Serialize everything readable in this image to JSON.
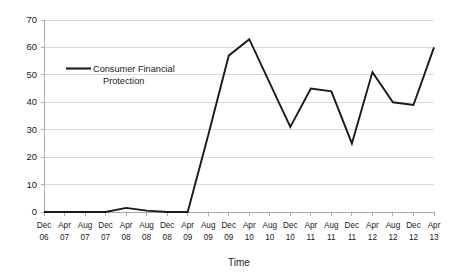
{
  "chart_data": {
    "type": "line",
    "title": "",
    "xlabel": "Time",
    "ylabel": "",
    "grid": true,
    "legend_position": "inside-upper-left",
    "xlim_categories": true,
    "ylim": [
      0,
      70
    ],
    "ytick_step": 10,
    "ytick_labels": [
      "0",
      "10",
      "20",
      "30",
      "40",
      "50",
      "60",
      "70"
    ],
    "ytick_values": [
      0,
      10,
      20,
      30,
      40,
      50,
      60,
      70
    ],
    "categories": [
      "Dec 06",
      "Apr 07",
      "Aug 07",
      "Dec 07",
      "Apr 08",
      "Aug 08",
      "Dec 08",
      "Apr 09",
      "Aug 09",
      "Dec 09",
      "Apr 10",
      "Aug 10",
      "Dec 10",
      "Apr 11",
      "Aug 11",
      "Dec 11",
      "Apr 12",
      "Aug 12",
      "Dec 12",
      "Apr 13"
    ],
    "categories_month": [
      "Dec",
      "Apr",
      "Aug",
      "Dec",
      "Apr",
      "Aug",
      "Dec",
      "Apr",
      "Aug",
      "Dec",
      "Apr",
      "Aug",
      "Dec",
      "Apr",
      "Aug",
      "Dec",
      "Apr",
      "Aug",
      "Dec",
      "Apr"
    ],
    "categories_year": [
      "06",
      "07",
      "07",
      "07",
      "08",
      "08",
      "08",
      "09",
      "09",
      "09",
      "10",
      "10",
      "10",
      "11",
      "11",
      "11",
      "12",
      "12",
      "12",
      "13"
    ],
    "series": [
      {
        "name": "Consumer Financial Protection",
        "color": "#1a1a1a",
        "values": [
          0,
          0,
          0,
          0,
          1.5,
          0.5,
          0,
          0,
          28,
          57,
          63,
          47,
          31,
          45,
          44,
          25,
          51,
          40,
          39,
          60
        ]
      }
    ],
    "annotations": []
  },
  "legend": {
    "entries": [
      {
        "label_line1": "Consumer Financial",
        "label_line2": "Protection",
        "color": "#1a1a1a"
      }
    ]
  },
  "axes": {
    "x_title": "Time",
    "y_title": ""
  },
  "colors": {
    "series": "#1a1a1a",
    "gridline": "#c9c9c9",
    "axis": "#9a9a9a",
    "background": "#ffffff",
    "text": "#1a1a1a"
  }
}
